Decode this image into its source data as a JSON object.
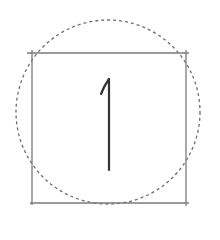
{
  "diagram": {
    "glyph": "1",
    "colors": {
      "background": "#ffffff",
      "square_stroke": "#7a7a7a",
      "circle_stroke": "#6e6e6e",
      "glyph_stroke": "#333333"
    },
    "square": {
      "x": 32,
      "y": 53,
      "width": 154,
      "height": 150
    },
    "circle": {
      "cx": 108,
      "cy": 112,
      "r": 92,
      "style": "dashed"
    }
  }
}
